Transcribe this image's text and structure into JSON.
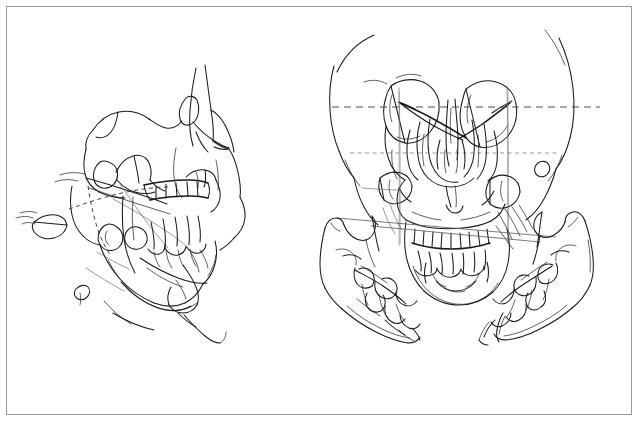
{
  "figure": {
    "domain": "line-drawing",
    "medium": "hand-drawn ink line art",
    "background_color": "#ffffff",
    "ink_color": "#1a1a1a",
    "guide_color": "#585858",
    "border_color": "#9a9a9a",
    "width": 639,
    "height": 423,
    "caption": "",
    "labels": [],
    "title": "",
    "views": [
      {
        "id": "lateral",
        "name": "lateral-skull-view",
        "description": "Oblique lateral view of facial skeleton with maxilla, mandible, zygomatic arch, nasal bones and dentition",
        "position": "left",
        "bbox": [
          40,
          60,
          250,
          300
        ]
      },
      {
        "id": "frontal",
        "name": "frontal-skull-view",
        "description": "Frontal (anteroposterior) view of skull with orbits, nasal aperture, maxillary dentition and reference lines",
        "position": "upper-right",
        "bbox": [
          320,
          25,
          300,
          260
        ]
      },
      {
        "id": "mandible-left",
        "name": "mandible-left-half-view",
        "description": "Detached left mandibular half with ramus, condyle, coronoid process and molar dentition",
        "position": "lower-right-left",
        "bbox": [
          315,
          210,
          130,
          150
        ]
      },
      {
        "id": "mandible-right",
        "name": "mandible-right-half-view",
        "description": "Detached right mandibular half with ramus, condyle, coronoid process and molar dentition",
        "position": "lower-right-right",
        "bbox": [
          465,
          205,
          135,
          155
        ]
      }
    ],
    "reference_lines": [
      {
        "id": "interorbital",
        "name": "interorbital-reference-line",
        "style": "dashed",
        "orientation": "horizontal",
        "view": "frontal"
      },
      {
        "id": "infraorbital",
        "name": "infraorbital-reference-line",
        "style": "dashed-short",
        "orientation": "horizontal",
        "view": "frontal"
      },
      {
        "id": "occlusal-upper",
        "name": "occlusal-plane-reference-line",
        "style": "solid",
        "orientation": "oblique",
        "view": "frontal"
      },
      {
        "id": "occlusal-lower",
        "name": "maxillary-plane-reference-line",
        "style": "solid",
        "orientation": "oblique",
        "view": "frontal"
      },
      {
        "id": "lateral-occlusal",
        "name": "lateral-occlusal-guide-line",
        "style": "dashed-short",
        "orientation": "oblique",
        "view": "lateral"
      }
    ]
  }
}
